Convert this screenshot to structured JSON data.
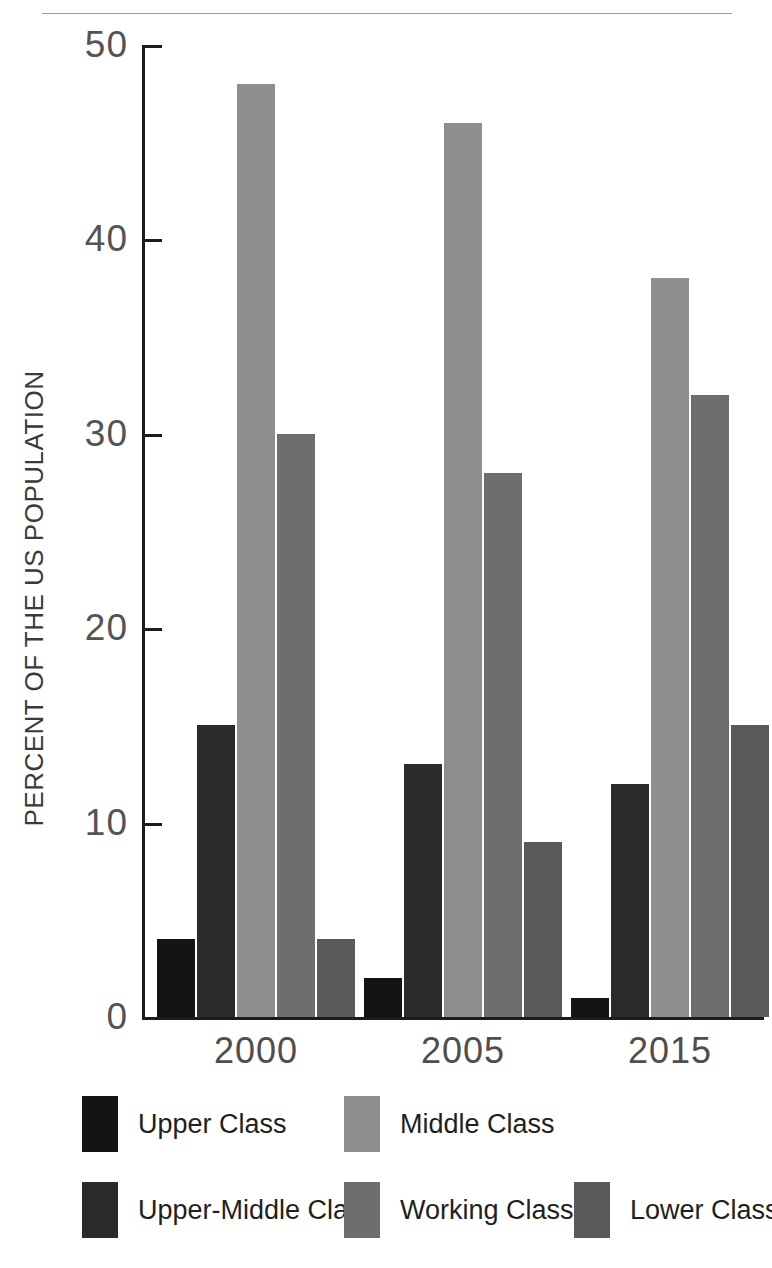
{
  "chart_data": {
    "type": "bar",
    "title": "",
    "subtitle": "",
    "xlabel": "",
    "ylabel": "PERCENT OF THE US POPULATION",
    "categories": [
      "2000",
      "2005",
      "2015"
    ],
    "ylim": [
      0,
      50
    ],
    "yticks": [
      "0",
      "10",
      "20",
      "30",
      "40",
      "50"
    ],
    "ytick_values": [
      0,
      10,
      20,
      30,
      40,
      50
    ],
    "grid": false,
    "legend_position": "bottom",
    "series": [
      {
        "name": "Upper Class",
        "values": [
          4,
          2,
          1
        ],
        "color": "#141414"
      },
      {
        "name": "Upper-Middle Class",
        "values": [
          15,
          13,
          12
        ],
        "color": "#2b2b2b"
      },
      {
        "name": "Middle Class",
        "values": [
          48,
          46,
          38
        ],
        "color": "#8e8e8e"
      },
      {
        "name": "Working Class",
        "values": [
          30,
          28,
          32
        ],
        "color": "#6e6e6e"
      },
      {
        "name": "Lower Class",
        "values": [
          4,
          9,
          15
        ],
        "color": "#5a5a5a"
      }
    ]
  },
  "axis": {
    "axis_color": "#1c1c1c",
    "tick_label_color": "#545454"
  },
  "legend": {
    "rows": [
      [
        {
          "label": "Upper Class",
          "color": "#141414",
          "left": 0,
          "swatch_left": 0
        },
        {
          "label": "Middle Class",
          "color": "#8e8e8e",
          "left": 262,
          "swatch_left": 262
        }
      ],
      [
        {
          "label": "Upper-Middle Class",
          "color": "#2b2b2b",
          "left": 0
        },
        {
          "label": "Working Class",
          "color": "#6e6e6e",
          "left": 262
        },
        {
          "label": "Lower Class",
          "color": "#5a5a5a",
          "left": 492
        }
      ]
    ]
  }
}
